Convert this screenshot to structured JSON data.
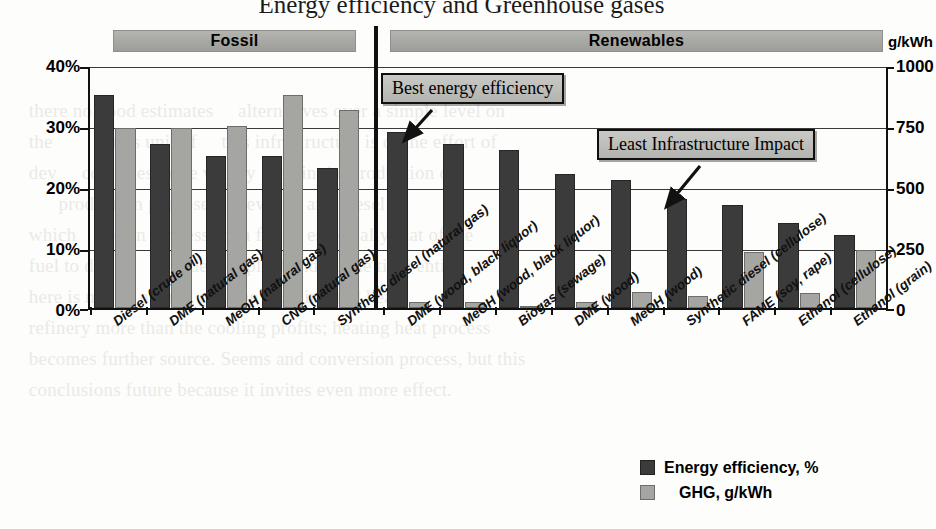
{
  "title": "Energy efficiency and Greenhouse gases",
  "bands": {
    "fossil": "Fossil",
    "renewables": "Renewables",
    "unit_right": "g/kWh"
  },
  "axes": {
    "left_ticks": [
      "40%",
      "30%",
      "20%",
      "10%",
      "0%"
    ],
    "right_ticks": [
      "1000",
      "750",
      "500",
      "250",
      "0"
    ]
  },
  "annotations": {
    "best_efficiency": "Best energy efficiency",
    "least_infrastructure": "Least Infrastructure Impact"
  },
  "legend": {
    "efficiency": "Energy efficiency, %",
    "ghg": "GHG, g/kWh"
  },
  "colors": {
    "efficiency_bar": "#3b3b3b",
    "ghg_bar": "#a5a5a1",
    "band": "#a9a9a5",
    "axis": "#111111"
  },
  "chart_data": {
    "type": "bar",
    "title": "Energy efficiency and Greenhouse gases",
    "xlabel": "",
    "ylabel": "",
    "y_left_label": "%",
    "y_right_label": "g/kWh",
    "ylim": [
      0,
      40
    ],
    "ylim_right": [
      0,
      1000
    ],
    "grid": true,
    "legend_position": "bottom-right",
    "groups": [
      "Fossil",
      "Renewables"
    ],
    "group_spans": [
      [
        0,
        4
      ],
      [
        5,
        13
      ]
    ],
    "categories": [
      "Diesel (crude oil)",
      "DME (natural gas)",
      "MeOH (natural gas)",
      "CNG (natural gas)",
      "Synthetic diesel (natural gas)",
      "DME (wood, black liquor)",
      "MeOH (wood, black liquor)",
      "Biogas (sewage)",
      "DME (wood)",
      "MeOH (wood)",
      "Synthetic diesel (cellulose)",
      "FAME (soy, rape)",
      "Ethanol (cellulose)",
      "Ethanol (grain)"
    ],
    "series": [
      {
        "name": "Energy efficiency, %",
        "unit": "%",
        "axis": "left",
        "color": "#3b3b3b",
        "values": [
          35,
          27,
          25,
          25,
          23,
          29,
          27,
          26,
          22,
          21,
          18,
          17,
          14,
          12
        ]
      },
      {
        "name": "GHG, g/kWh",
        "unit": "g/kWh",
        "axis": "right",
        "color": "#a5a5a1",
        "values": [
          740,
          740,
          750,
          875,
          815,
          25,
          25,
          10,
          25,
          65,
          50,
          230,
          60,
          240
        ]
      }
    ]
  }
}
